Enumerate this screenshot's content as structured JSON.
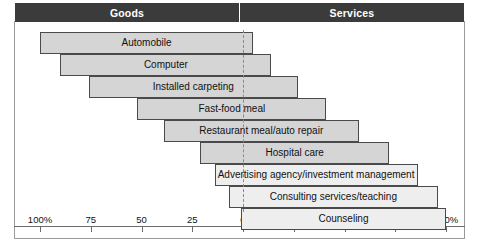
{
  "header": {
    "left_label": "Goods",
    "right_label": "Services",
    "divider_color": "#ffffff",
    "background_color": "#3b3b3b",
    "text_color": "#ffffff"
  },
  "axis": {
    "left_ticks": [
      {
        "label": "100%",
        "value": 100
      },
      {
        "label": "75",
        "value": 75
      },
      {
        "label": "50",
        "value": 50
      },
      {
        "label": "25",
        "value": 25
      }
    ],
    "center_tick": {
      "label": "0",
      "value": 0
    },
    "right_ticks": [
      {
        "label": "25",
        "value": 25
      },
      {
        "label": "50",
        "value": 50
      },
      {
        "label": "75",
        "value": 75
      },
      {
        "label": "100%",
        "value": 100
      }
    ]
  },
  "chart_data": {
    "type": "bar",
    "title": "",
    "subtitle": "",
    "xlabel": "",
    "ylabel": "",
    "orientation": "horizontal",
    "layout": "diverging-staircase",
    "grid": false,
    "legend": null,
    "axis_center_value": 0,
    "xlim": [
      -100,
      100
    ],
    "left_axis_name": "Goods",
    "right_axis_name": "Services",
    "left_axis_ticks": [
      "100%",
      "75",
      "50",
      "25",
      "0"
    ],
    "right_axis_ticks": [
      "0",
      "25",
      "50",
      "75",
      "100%"
    ],
    "categories": [
      "Automobile",
      "Computer",
      "Installed carpeting",
      "Fast-food meal",
      "Restaurant meal/auto repair",
      "Hospital care",
      "Advertising agency/investment management",
      "Consulting services/teaching",
      "Counseling"
    ],
    "series": [
      {
        "name": "Goods",
        "values": [
          100,
          90,
          76,
          52,
          39,
          21,
          14,
          7,
          1
        ]
      },
      {
        "name": "Services",
        "values": [
          5,
          14,
          27,
          41,
          57,
          72,
          86,
          96,
          100
        ]
      }
    ],
    "bar_fill_color": "#d5d5d5",
    "bar_highlight_fill_color": "#eeeeee",
    "bar_border_color": "#4a4a4a"
  },
  "bars": [
    {
      "label": "Automobile",
      "goods": 100,
      "services": 5,
      "highlight": false
    },
    {
      "label": "Computer",
      "goods": 90,
      "services": 14,
      "highlight": false
    },
    {
      "label": "Installed carpeting",
      "goods": 76,
      "services": 27,
      "highlight": false
    },
    {
      "label": "Fast-food meal",
      "goods": 52,
      "services": 41,
      "highlight": false
    },
    {
      "label": "Restaurant meal/auto repair",
      "goods": 39,
      "services": 57,
      "highlight": false
    },
    {
      "label": "Hospital care",
      "goods": 21,
      "services": 72,
      "highlight": false
    },
    {
      "label": "Advertising agency/investment management",
      "goods": 14,
      "services": 86,
      "highlight": true
    },
    {
      "label": "Consulting services/teaching",
      "goods": 7,
      "services": 96,
      "highlight": true
    },
    {
      "label": "Counseling",
      "goods": 1,
      "services": 100,
      "highlight": true
    }
  ]
}
